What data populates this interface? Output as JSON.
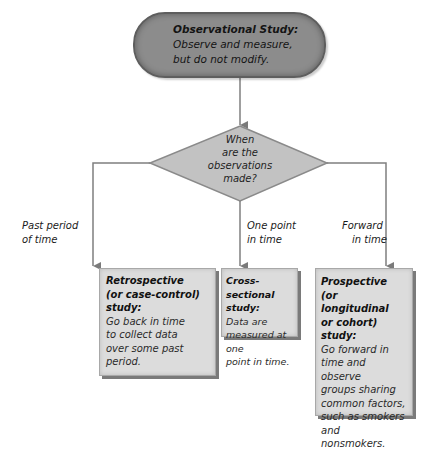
{
  "diagram": {
    "root": {
      "title": "Observational Study:",
      "line1": "Observe and measure,",
      "line2": "but do not modify."
    },
    "decision": {
      "line1": "When",
      "line2": "are the",
      "line3": "observations",
      "line4": "made?"
    },
    "branches": [
      {
        "label_line1": "Past period",
        "label_line2": "of time",
        "title_lines": [
          "Retrospective",
          "(or case-control)",
          "study:"
        ],
        "desc_lines": [
          "Go back in time",
          "to collect data",
          "over some past",
          "period."
        ]
      },
      {
        "label_line1": "One point",
        "label_line2": "in time",
        "title_lines": [
          "Cross-sectional",
          "study:"
        ],
        "desc_lines": [
          "Data are",
          "measured at one",
          "point in time."
        ]
      },
      {
        "label_line1": "Forward",
        "label_line2": "in time",
        "title_lines": [
          "Prospective",
          "(or longitudinal",
          "or cohort) study:"
        ],
        "desc_lines": [
          "Go forward in",
          "time and observe",
          "groups sharing",
          "common factors,",
          "such as smokers",
          "and nonsmokers."
        ]
      }
    ],
    "colors": {
      "root_fill": "#8c8c8c",
      "diamond_fill": "#c2c2c2",
      "box_fill": "#dcdcdc",
      "line": "#7f7f7f"
    }
  }
}
